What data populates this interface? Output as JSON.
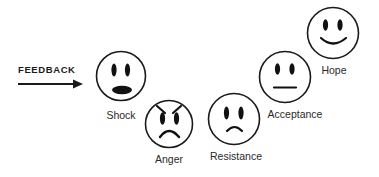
{
  "diagram": {
    "colors": {
      "stroke": "#1a1a1a",
      "text": "#2a2a2a",
      "background": "#ffffff"
    },
    "feedback": {
      "label": "FEEDBACK",
      "arrow_icon": "right-arrow-icon"
    },
    "stages": [
      {
        "id": "shock",
        "label": "Shock",
        "expression": "open-mouth-shocked",
        "order": 1
      },
      {
        "id": "anger",
        "label": "Anger",
        "expression": "angry-frown-with-brows",
        "order": 2
      },
      {
        "id": "resistance",
        "label": "Resistance",
        "expression": "slight-frown",
        "order": 3
      },
      {
        "id": "acceptance",
        "label": "Acceptance",
        "expression": "neutral-flat-mouth",
        "order": 4
      },
      {
        "id": "hope",
        "label": "Hope",
        "expression": "smile",
        "order": 5
      }
    ]
  }
}
